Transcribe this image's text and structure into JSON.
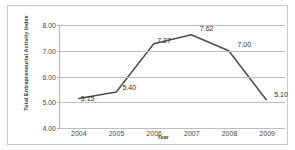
{
  "chart_data": {
    "type": "line",
    "title": "",
    "subtitle": "",
    "xlabel": "Year",
    "ylabel": "Total Entrepreneurial Activity Index",
    "categories": [
      "2004",
      "2005",
      "2006",
      "2007",
      "2008",
      "2009"
    ],
    "x": [
      2004,
      2005,
      2006,
      2007,
      2008,
      2009
    ],
    "values": [
      5.15,
      5.4,
      7.27,
      7.62,
      7.0,
      5.1
    ],
    "point_labels": [
      "5.15",
      "5.40",
      "7.27",
      "7.62",
      "7.00",
      "5.10"
    ],
    "ylim": [
      4.0,
      8.0
    ],
    "yticks": [
      4.0,
      5.0,
      6.0,
      7.0,
      8.0
    ],
    "ytick_labels": [
      "4.00",
      "5.00",
      "6.00",
      "7.00",
      "8.00"
    ],
    "xtick_labels": [
      "2004",
      "2005",
      "2006",
      "2007",
      "2008",
      "2009"
    ],
    "grid": true,
    "grid_axis": "y",
    "legend": false,
    "legend_position": "none",
    "series": [
      {
        "name": "Total Entrepreneurial Activity Index",
        "values": [
          5.15,
          5.4,
          7.27,
          7.62,
          7.0,
          5.1
        ]
      }
    ],
    "colors": {
      "line": "#4d4d4d",
      "gridline": "#bdbdbd",
      "axis": "#b5b5b5",
      "text": "#3a3a3a",
      "tick_text": "#4a4a4a",
      "background": "#ffffff",
      "frame": "#c9c9c9"
    }
  }
}
